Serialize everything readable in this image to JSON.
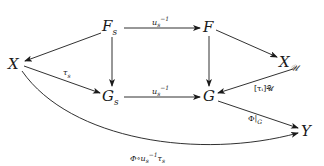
{
  "diagram": {
    "type": "commutative-diagram",
    "nodes": {
      "Fs": {
        "base": "F",
        "sub": "s"
      },
      "F": {
        "base": "F",
        "sub": ""
      },
      "X": {
        "base": "X",
        "sub": ""
      },
      "XU": {
        "base": "X",
        "sub": "𝒰"
      },
      "Gs": {
        "base": "G",
        "sub": "s"
      },
      "G": {
        "base": "G",
        "sub": ""
      },
      "Y": {
        "base": "Y",
        "sub": ""
      }
    },
    "labels": {
      "Fs_F": {
        "base": "u",
        "sub": "s",
        "sup": "−1"
      },
      "Gs_G": {
        "base": "u",
        "sub": "s",
        "sup": "−1"
      },
      "X_Gs": {
        "base": "τ",
        "sub": "s",
        "sup": ""
      },
      "XU_G": {
        "text": "[τᵢ]𝒰"
      },
      "G_Y": {
        "text": "Φ|",
        "sub": "G"
      },
      "X_Y": {
        "pre": "Φ∘u",
        "sub": "s",
        "sup": "−1",
        "post": "τ",
        "post_sub": "s"
      }
    },
    "edges": [
      {
        "from": "Fs",
        "to": "F",
        "label": "Fs_F"
      },
      {
        "from": "Fs",
        "to": "X",
        "label": ""
      },
      {
        "from": "Fs",
        "to": "Gs",
        "label": ""
      },
      {
        "from": "F",
        "to": "XU",
        "label": ""
      },
      {
        "from": "F",
        "to": "G",
        "label": ""
      },
      {
        "from": "X",
        "to": "Gs",
        "label": "X_Gs"
      },
      {
        "from": "XU",
        "to": "G",
        "label": "XU_G"
      },
      {
        "from": "Gs",
        "to": "G",
        "label": "Gs_G"
      },
      {
        "from": "G",
        "to": "Y",
        "label": "G_Y"
      },
      {
        "from": "X",
        "to": "Y",
        "label": "X_Y",
        "curved": true
      }
    ]
  }
}
